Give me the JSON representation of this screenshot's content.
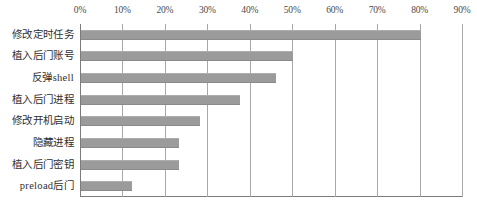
{
  "chart_data": {
    "type": "bar",
    "orientation": "horizontal",
    "title": "",
    "xlabel": "",
    "ylabel": "",
    "xlim": [
      0,
      90
    ],
    "x_tick_labels": [
      "0%",
      "10%",
      "20%",
      "30%",
      "40%",
      "50%",
      "60%",
      "70%",
      "80%",
      "90%"
    ],
    "x_tick_values": [
      0,
      10,
      20,
      30,
      40,
      50,
      60,
      70,
      80,
      90
    ],
    "grid": true,
    "legend": false,
    "bar_color": "#9b9b9b",
    "categories": [
      "修改定时任务",
      "植入后门账号",
      "反弹shell",
      "植入后门进程",
      "修改开机启动",
      "隐藏进程",
      "植入后门密钥",
      "preload后门"
    ],
    "values": [
      80,
      50,
      46,
      37.5,
      28,
      23,
      23,
      12
    ],
    "value_labels": [
      "80%",
      "50%",
      "46%",
      "37.5%",
      "28%",
      "23%",
      "23%",
      "12%"
    ]
  },
  "caption": ""
}
